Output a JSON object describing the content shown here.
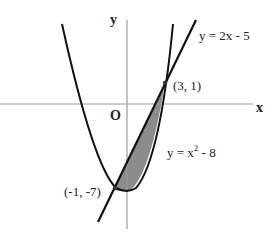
{
  "diagram": {
    "axes": {
      "x_label": "x",
      "y_label": "y",
      "origin_label": "O"
    },
    "curves": [
      {
        "id": "parabola",
        "label_main": "y = x",
        "label_sup": "2",
        "label_tail": " - 8",
        "color": "#111111"
      },
      {
        "id": "line",
        "label": "y = 2x - 5",
        "color": "#111111"
      }
    ],
    "points": [
      {
        "label": "(3, 1)"
      },
      {
        "label": "(-1, -7)"
      }
    ],
    "shaded_region": {
      "fill": "#8c8c8c"
    },
    "colors": {
      "axis": "#9a9a9a",
      "curve": "#111111",
      "background": "#ffffff"
    }
  }
}
